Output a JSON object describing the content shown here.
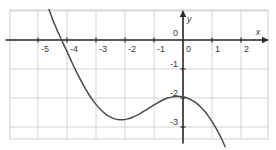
{
  "chart_data": {
    "type": "line",
    "title": "",
    "xlabel": "x",
    "ylabel": "y",
    "xlim": [
      -5.9,
      2.9
    ],
    "ylim": [
      -3.8,
      1.0
    ],
    "grid": true,
    "grid_spacing": 1,
    "legend": "none",
    "origin_label": "0",
    "origin_label_upper": "0",
    "x_ticks": [
      "-5",
      "-4",
      "-3",
      "-2",
      "-1",
      "0",
      "1",
      "2"
    ],
    "x_tick_values": [
      -5,
      -4,
      -3,
      -2,
      -1,
      0,
      1,
      2
    ],
    "y_ticks": [
      "-1",
      "-2",
      "-3"
    ],
    "y_tick_values": [
      -1,
      -2,
      -3
    ],
    "series": [
      {
        "name": "cubic curve",
        "description": "descending cubic with local minimum near (-2.2,-2.75) and local maximum near (-0.15,-1.95)",
        "x": [
          -4.62,
          -4.5,
          -4.4,
          -4.3,
          -4.2,
          -4.15,
          -4.0,
          -3.85,
          -3.7,
          -3.55,
          -3.4,
          -3.25,
          -3.1,
          -2.95,
          -2.8,
          -2.65,
          -2.5,
          -2.35,
          -2.2,
          -2.05,
          -1.9,
          -1.75,
          -1.6,
          -1.45,
          -1.3,
          -1.15,
          -1.0,
          -0.85,
          -0.7,
          -0.55,
          -0.4,
          -0.25,
          -0.15,
          0.0,
          0.15,
          0.3,
          0.45,
          0.6,
          0.75,
          0.9,
          1.05,
          1.2,
          1.35,
          1.45
        ],
        "y": [
          1.05,
          0.72,
          0.48,
          0.24,
          0.03,
          -0.08,
          -0.4,
          -0.73,
          -1.05,
          -1.34,
          -1.62,
          -1.87,
          -2.09,
          -2.28,
          -2.44,
          -2.57,
          -2.66,
          -2.72,
          -2.75,
          -2.75,
          -2.72,
          -2.67,
          -2.6,
          -2.52,
          -2.43,
          -2.33,
          -2.24,
          -2.15,
          -2.07,
          -2.01,
          -1.97,
          -1.95,
          -1.95,
          -1.96,
          -2.0,
          -2.07,
          -2.17,
          -2.3,
          -2.46,
          -2.66,
          -2.89,
          -3.15,
          -3.45,
          -3.68
        ]
      }
    ],
    "colors": {
      "curve": "#4a4a4a",
      "axis": "#2b2b2b",
      "grid": "#c9c9cf",
      "background": "#ffffff",
      "label": "#3a3a3a"
    }
  },
  "labels": {
    "x_axis_name": "x",
    "y_axis_name": "y"
  }
}
